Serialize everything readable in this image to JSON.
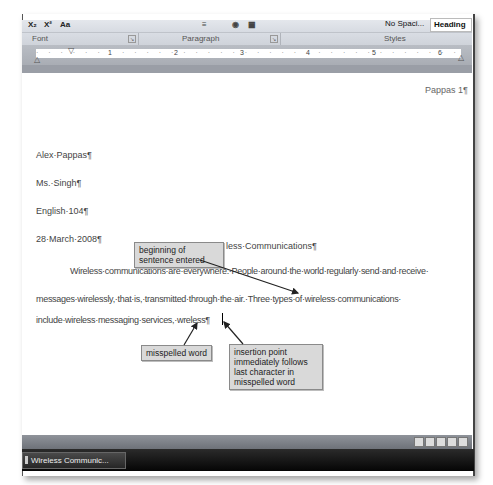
{
  "ribbon": {
    "font_tools": [
      "X₂",
      "X²",
      "Aa"
    ],
    "styles_gallery": [
      "No Spaci...",
      "Heading 1"
    ],
    "group_labels": [
      "Font",
      "Paragraph",
      "Styles"
    ]
  },
  "ruler": {
    "numbers": [
      "1",
      "2",
      "3",
      "4",
      "5",
      "6"
    ]
  },
  "document": {
    "header": "Pappas 1¶",
    "lines": [
      "Alex·Pappas¶",
      "Ms.·Singh¶",
      "English·104¶",
      "28·March·2008¶"
    ],
    "title_fragment": "less·Communications¶",
    "body": [
      "Wireless·communications·are·everywhere.·People·around·the·world·regularly·send·and·receive·",
      "messages·wirelessly,·that·is,·transmitted·through·the·air.·Three·types·of·wireless·communications·",
      "include·wireless·messaging·services,·wreless¶"
    ]
  },
  "callouts": {
    "beginning": "beginning of sentence entered",
    "misspelled": "misspelled word",
    "insertion": "insertion point immediately follows last character in misspelled word"
  },
  "taskbar": {
    "button_label": "Wireless Communic..."
  }
}
